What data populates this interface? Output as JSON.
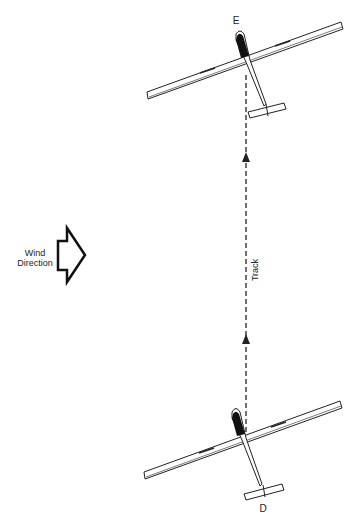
{
  "labels": {
    "glider_top": "E",
    "glider_bottom": "D",
    "wind_line1": "Wind",
    "wind_line2": "Direction",
    "track": "Track"
  },
  "colors": {
    "stroke": "#222222",
    "background": "#ffffff"
  }
}
